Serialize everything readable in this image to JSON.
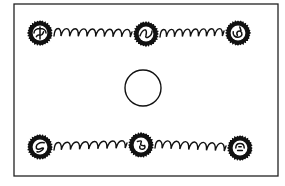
{
  "diagram": {
    "width": 285,
    "height": 186,
    "background": "#ffffff",
    "ink": "#111111",
    "frame": {
      "x": 14,
      "y": 4,
      "w": 264,
      "h": 172
    },
    "center_circle": {
      "cx": 143,
      "cy": 88,
      "r": 18
    },
    "nodes": [
      {
        "id": "top-left",
        "cx": 40,
        "cy": 33,
        "r": 11
      },
      {
        "id": "top-middle",
        "cx": 146,
        "cy": 34,
        "r": 11
      },
      {
        "id": "top-right",
        "cx": 238,
        "cy": 33,
        "r": 11
      },
      {
        "id": "bottom-left",
        "cx": 40,
        "cy": 147,
        "r": 11
      },
      {
        "id": "bottom-middle",
        "cx": 141,
        "cy": 145,
        "r": 11
      },
      {
        "id": "bottom-right",
        "cx": 240,
        "cy": 148,
        "r": 11
      }
    ],
    "springs": [
      {
        "from": "top-left",
        "to": "top-middle",
        "coils": 9
      },
      {
        "from": "top-middle",
        "to": "top-right",
        "coils": 8
      },
      {
        "from": "bottom-left",
        "to": "bottom-middle",
        "coils": 8
      },
      {
        "from": "bottom-middle",
        "to": "bottom-right",
        "coils": 8
      }
    ]
  }
}
